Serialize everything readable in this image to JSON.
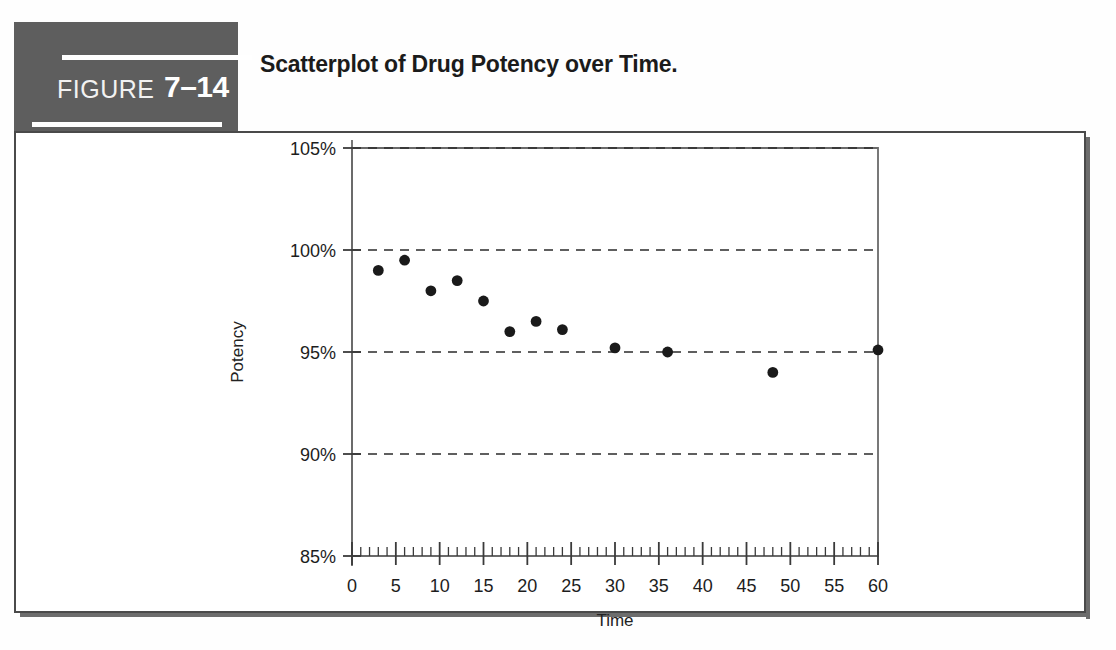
{
  "figure": {
    "label_word": "FIGURE",
    "number": "7–14",
    "title": "Scatterplot of Drug Potency over Time.",
    "header_bg": "#5e5e5e",
    "rule_color": "#ffffff",
    "frame_color": "#4a4a4a"
  },
  "chart_data": {
    "type": "scatter",
    "title": "Scatterplot of Drug Potency over Time.",
    "xlabel": "Time",
    "ylabel": "Potency",
    "xlim": [
      0,
      60
    ],
    "ylim": [
      85,
      105
    ],
    "xticks": [
      0,
      5,
      10,
      15,
      20,
      25,
      30,
      35,
      40,
      45,
      50,
      55,
      60
    ],
    "xticklabels": [
      "0",
      "5",
      "10",
      "15",
      "20",
      "25",
      "30",
      "35",
      "40",
      "45",
      "50",
      "55",
      "60"
    ],
    "yticks": [
      85,
      90,
      95,
      100,
      105
    ],
    "yticklabels": [
      "85%",
      "90%",
      "95%",
      "100%",
      "105%"
    ],
    "x_minor_tick_step": 1,
    "grid": "horizontal-dashed",
    "gridlines_at": [
      90,
      95,
      100,
      105
    ],
    "legend": null,
    "marker": "filled-circle",
    "marker_color": "#1a1a1a",
    "points": [
      {
        "x": 3,
        "y": 99.0
      },
      {
        "x": 6,
        "y": 99.5
      },
      {
        "x": 9,
        "y": 98.0
      },
      {
        "x": 12,
        "y": 98.5
      },
      {
        "x": 15,
        "y": 97.5
      },
      {
        "x": 18,
        "y": 96.0
      },
      {
        "x": 21,
        "y": 96.5
      },
      {
        "x": 24,
        "y": 96.1
      },
      {
        "x": 30,
        "y": 95.2
      },
      {
        "x": 36,
        "y": 95.0
      },
      {
        "x": 48,
        "y": 94.0
      },
      {
        "x": 60,
        "y": 95.1
      }
    ]
  }
}
